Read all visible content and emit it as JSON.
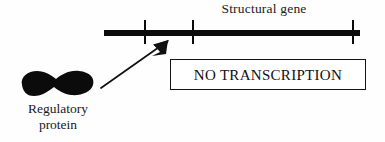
{
  "diagram": {
    "background_color": "#fefefe",
    "ink_color": "#0b0b0b"
  },
  "gene": {
    "label": "Structural gene",
    "bar": {
      "x": 104,
      "y": 30,
      "width": 256,
      "height": 6,
      "color": "#0b0b0b"
    },
    "ticks": [
      {
        "name": "tick-1",
        "x": 40
      },
      {
        "name": "tick-2",
        "x": 88
      },
      {
        "name": "tick-3",
        "x": 248
      }
    ]
  },
  "protein": {
    "label_line1": "Regulatory",
    "label_line2": "protein",
    "shape": "bilobed-blob",
    "color": "#0b0b0b"
  },
  "arrow": {
    "name": "binding-arrow",
    "from": {
      "x": 9,
      "y": 56
    },
    "to": {
      "x": 76,
      "y": 9
    },
    "color": "#111111"
  },
  "callout": {
    "text": "NO TRANSCRIPTION",
    "border_color": "#121212",
    "fill_color": "#ffffff"
  }
}
